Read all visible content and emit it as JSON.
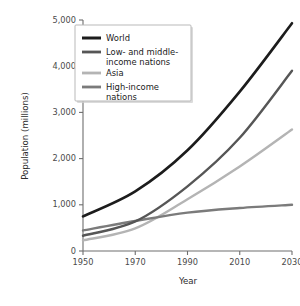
{
  "chart_data": {
    "type": "line",
    "title": "",
    "xlabel": "Year",
    "ylabel": "Population (millions)",
    "x": [
      1950,
      1970,
      1990,
      2010,
      2030
    ],
    "xlim": [
      1950,
      2030
    ],
    "ylim": [
      0,
      5000
    ],
    "xticks": [
      "1950",
      "1970",
      "1990",
      "2010",
      "2030"
    ],
    "yticks": [
      "0",
      "1,000",
      "2,000",
      "3,000",
      "4,000",
      "5,000"
    ],
    "ytick_values": [
      0,
      1000,
      2000,
      3000,
      4000,
      5000
    ],
    "grid": false,
    "legend_position": "upper-left-inside",
    "series": [
      {
        "name": "World",
        "color": "#1c1c1c",
        "width": 2.6,
        "values": [
          750,
          1290,
          2180,
          3450,
          4930
        ]
      },
      {
        "name": "Low- and middle-income nations",
        "color": "#565656",
        "width": 2.4,
        "values": [
          330,
          640,
          1400,
          2450,
          3900
        ]
      },
      {
        "name": "Asia",
        "color": "#b4b4b4",
        "width": 2.4,
        "values": [
          230,
          490,
          1120,
          1830,
          2630
        ]
      },
      {
        "name": "High-income nations",
        "color": "#7b7b7b",
        "width": 2.4,
        "values": [
          445,
          650,
          830,
          930,
          1000
        ]
      }
    ]
  },
  "legend": {
    "entries": [
      {
        "label_line1": "World",
        "label_line2": ""
      },
      {
        "label_line1": "Low- and middle-",
        "label_line2": "income nations"
      },
      {
        "label_line1": "Asia",
        "label_line2": ""
      },
      {
        "label_line1": "High-income",
        "label_line2": "nations"
      }
    ]
  }
}
